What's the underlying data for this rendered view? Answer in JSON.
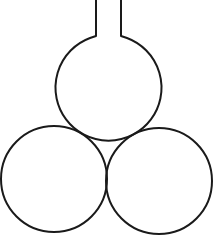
{
  "diagram": {
    "stroke_color": "#1a1a1a",
    "background_color": "#ffffff",
    "stroke_width": 2,
    "flask": {
      "neck": {
        "left_x": 96,
        "right_x": 121,
        "top_y": 0,
        "bottom_y": 36
      },
      "bulb": {
        "cx": 107,
        "cy": 90,
        "r": 53
      }
    },
    "support_spheres": [
      {
        "name": "left",
        "cx": 54,
        "cy": 179,
        "r": 53
      },
      {
        "name": "right",
        "cx": 159,
        "cy": 181,
        "r": 53
      }
    ]
  }
}
